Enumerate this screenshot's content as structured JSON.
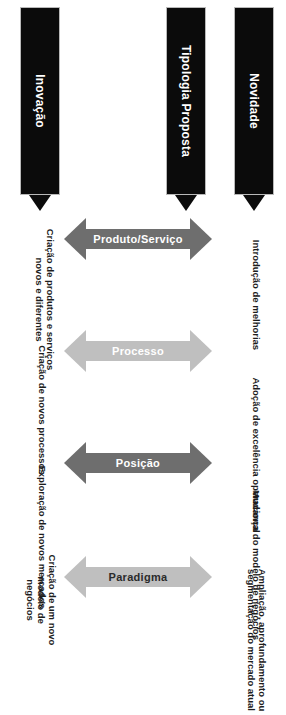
{
  "diagram": {
    "orientation": "rotated-90",
    "colors": {
      "header_bar": "#0b0b0b",
      "header_text": "#ffffff",
      "arrow_light": "#bfbfbf",
      "arrow_dark": "#6e6e6e",
      "caption_text": "#1d1d1d",
      "background": "#ffffff"
    },
    "columns": [
      {
        "key": "produto_servico",
        "arrow_label": "Produto/Serviço",
        "arrow_tone": "dark",
        "novidade": "Introdução de melhorias",
        "inovacao": "Criação de produtos e serviços\nnovos e diferentes"
      },
      {
        "key": "processo",
        "arrow_label": "Processo",
        "arrow_tone": "light",
        "novidade": "Adoção de excelência operacional",
        "inovacao": "Criação de novos processos"
      },
      {
        "key": "posicao",
        "arrow_label": "Posição",
        "arrow_tone": "dark",
        "novidade": "Ampliação, aprofundamento ou\nsegmentação do mercado atual",
        "inovacao": "Exploração de novos mercados"
      },
      {
        "key": "paradigma",
        "arrow_label": "Paradigma",
        "arrow_tone": "light",
        "novidade": "Mudança do modelo de negócios",
        "inovacao": "Criação de um novo modelo de\nnegócios"
      }
    ],
    "headers": {
      "novidade": "Novidade",
      "tipologia": "Tipologia Proposta",
      "inovacao": "Inovação"
    }
  }
}
